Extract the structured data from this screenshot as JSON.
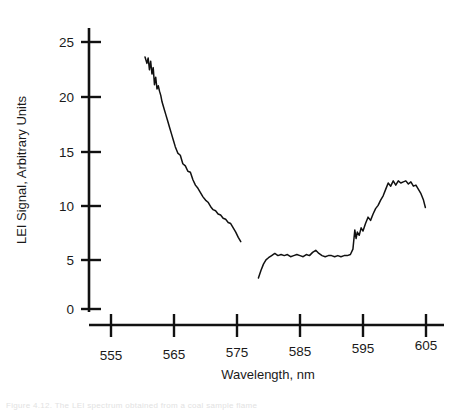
{
  "figure": {
    "caption_partial": "Figure 4.12.  The LEI spectrum obtained from a coal sample flame",
    "background_color": "#ffffff",
    "line_color": "#111111",
    "axis_color": "#111111"
  },
  "chart_data": {
    "type": "line",
    "title": "",
    "subtitle": "",
    "xlabel": "Wavelength, nm",
    "ylabel": "LEI Signal, Arbitrary Units",
    "xlim": [
      550,
      607
    ],
    "ylim": [
      -2,
      27
    ],
    "xticks": [
      555,
      565,
      575,
      585,
      595,
      605
    ],
    "xtick_labels": [
      "555",
      "565",
      "575",
      "585",
      "595",
      "605"
    ],
    "yticks": [
      0,
      5,
      10,
      15,
      20,
      25
    ],
    "ytick_labels": [
      "0",
      "5",
      "10",
      "15",
      "20",
      "25"
    ],
    "grid": false,
    "legend": null,
    "axis_style": "offset-detached-spines",
    "series": [
      {
        "name": "LEI spectrum segment 1",
        "x": [
          560.4,
          560.7,
          560.9,
          561.1,
          561.3,
          561.5,
          561.7,
          561.9,
          562.1,
          562.3,
          562.5,
          562.7,
          562.9,
          563.1,
          563.4,
          563.7,
          564.0,
          564.3,
          564.6,
          564.9,
          565.2,
          565.6,
          566.0,
          566.4,
          566.8,
          567.2,
          567.6,
          568.0,
          568.4,
          568.8,
          569.2,
          569.6,
          570.0,
          570.4,
          570.8,
          571.2,
          571.6,
          572.0,
          572.4,
          572.8,
          573.2,
          573.6,
          574.0,
          574.4,
          574.8,
          575.2,
          575.6
        ],
        "y": [
          23.6,
          23.0,
          23.5,
          22.4,
          23.2,
          22.0,
          22.6,
          21.0,
          21.7,
          20.6,
          20.9,
          20.4,
          20.0,
          19.4,
          18.8,
          18.2,
          17.6,
          17.0,
          16.4,
          15.8,
          15.2,
          14.6,
          14.4,
          13.6,
          13.4,
          12.9,
          12.8,
          12.1,
          11.6,
          11.3,
          10.9,
          10.5,
          10.2,
          10.0,
          9.6,
          9.3,
          9.2,
          8.9,
          8.8,
          8.5,
          8.4,
          8.1,
          8.0,
          7.6,
          7.2,
          6.7,
          6.3
        ]
      },
      {
        "name": "LEI spectrum segment 2",
        "x": [
          578.4,
          578.8,
          579.2,
          579.6,
          580.0,
          580.5,
          581.0,
          581.5,
          582.0,
          582.5,
          583.0,
          583.5,
          584.0,
          584.5,
          585.0,
          585.5,
          586.0,
          586.5,
          587.0,
          587.5,
          588.0,
          588.5,
          589.0,
          589.5,
          590.0,
          590.5,
          591.0,
          591.5,
          592.0,
          592.5,
          593.0,
          593.4,
          593.7,
          593.9,
          594.1,
          594.4,
          594.7,
          595.0,
          595.4,
          595.8,
          596.2,
          596.6,
          597.0,
          597.4,
          597.8,
          598.2,
          598.6,
          599.0,
          599.4,
          599.8,
          600.2,
          600.6,
          601.0,
          601.4,
          601.8,
          602.2,
          602.6,
          603.0,
          603.4,
          603.8,
          604.2,
          604.6,
          604.9
        ],
        "y": [
          2.9,
          3.6,
          4.2,
          4.6,
          4.8,
          5.0,
          5.2,
          5.0,
          5.1,
          5.0,
          5.1,
          4.9,
          5.0,
          5.1,
          5.0,
          4.9,
          5.1,
          5.0,
          5.3,
          5.5,
          5.2,
          5.0,
          4.9,
          5.0,
          5.0,
          4.9,
          5.0,
          4.9,
          5.0,
          5.0,
          5.1,
          5.6,
          7.4,
          6.6,
          7.2,
          6.9,
          7.6,
          7.3,
          8.0,
          8.6,
          8.3,
          8.9,
          9.4,
          9.7,
          10.2,
          10.6,
          11.2,
          11.8,
          11.5,
          12.0,
          11.6,
          12.0,
          11.8,
          11.9,
          12.0,
          11.7,
          11.9,
          11.5,
          11.6,
          11.2,
          10.8,
          10.2,
          9.5
        ]
      }
    ],
    "notes": [
      "Spectrum plotted as two disconnected traces with a data gap between ~575.6 nm and ~578.4 nm.",
      "Segment 1 decays monotonically from ~23.6 at 560 nm to ~6.3 at 575.6 nm with fine noise spikes.",
      "Segment 2 rises from ~2.9 at 578.4 nm, plateaus near 5 through ~593 nm, jumps at ~593.7 nm, and peaks near ~12 around 599-602 nm before falling to ~9.5."
    ]
  }
}
